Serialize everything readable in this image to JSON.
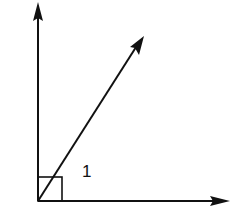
{
  "diagram": {
    "type": "geometry-angles",
    "vertex": {
      "x": 38,
      "y": 201
    },
    "rays": [
      {
        "name": "vertical-ray",
        "end": {
          "x": 38,
          "y": 4
        }
      },
      {
        "name": "diagonal-ray",
        "end": {
          "x": 143,
          "y": 37
        }
      },
      {
        "name": "horizontal-ray",
        "end": {
          "x": 228,
          "y": 201
        }
      }
    ],
    "right_angle_marker": {
      "x": 38,
      "y": 177,
      "size": 24
    },
    "angle_label": "1",
    "stroke_color": "#111111"
  }
}
